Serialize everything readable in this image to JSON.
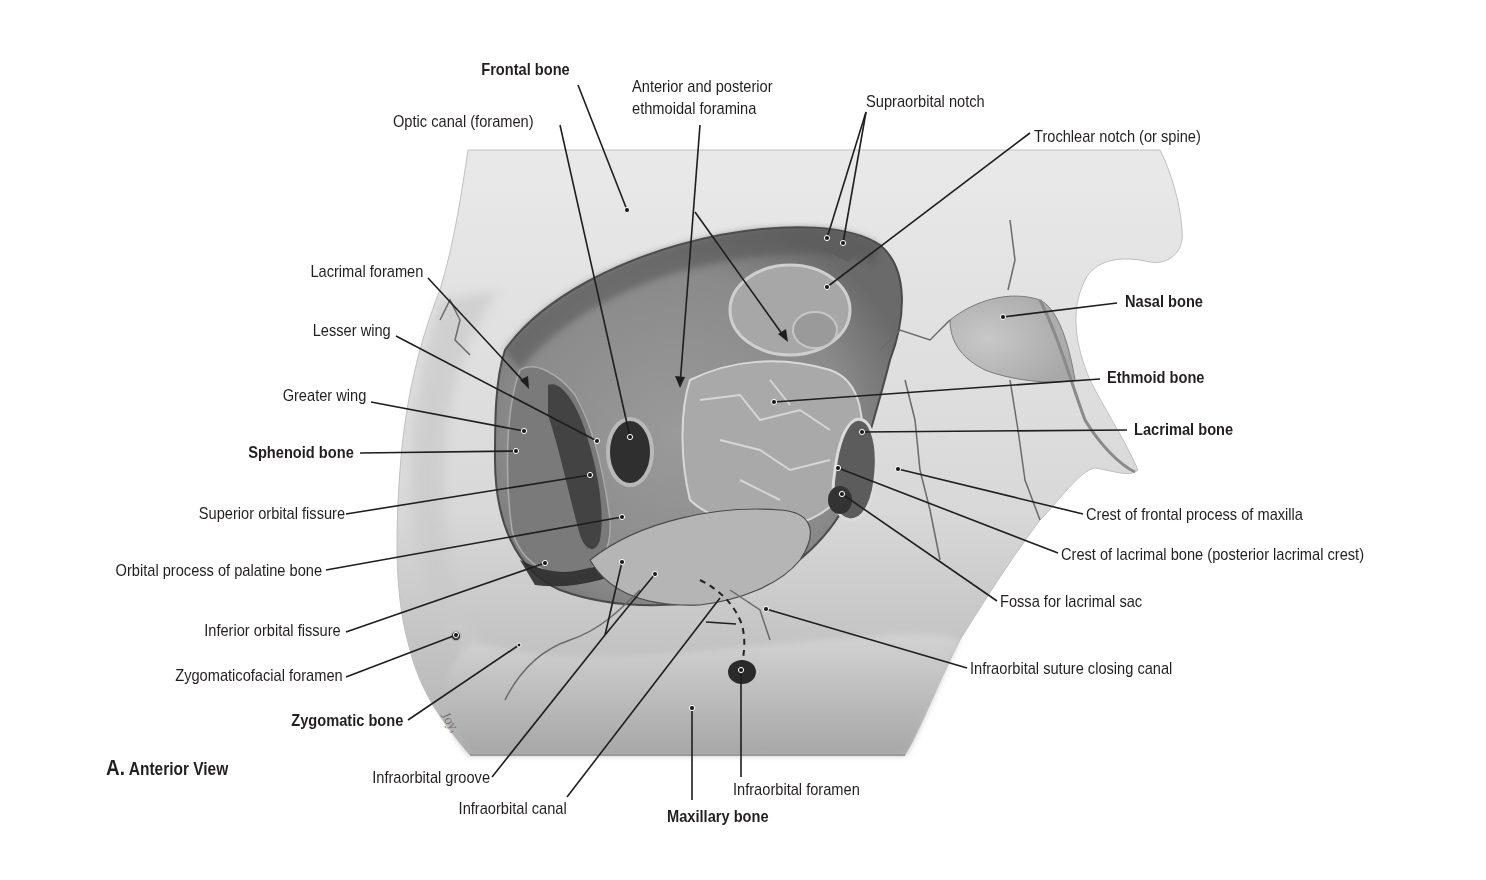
{
  "figure": {
    "caption_letter": "A.",
    "caption_view": "Anterior View",
    "signature": "Joy",
    "colors": {
      "background": "#ffffff",
      "text": "#231f20",
      "leader_line": "#1e1e1e",
      "bone_light": "#e6e6e6",
      "bone_mid": "#b9b9b9",
      "orbit_dark": "#6f6f6f",
      "foramen_dark": "#2e2e2e"
    }
  },
  "labels": {
    "frontal_bone": "Frontal bone",
    "optic_canal": "Optic canal (foramen)",
    "ethmoidal_foramina_line1": "Anterior and posterior",
    "ethmoidal_foramina_line2": "ethmoidal foramina",
    "supraorbital_notch": "Supraorbital notch",
    "trochlear_notch": "Trochlear notch (or spine)",
    "lacrimal_foramen": "Lacrimal foramen",
    "lesser_wing": "Lesser wing",
    "greater_wing": "Greater wing",
    "sphenoid_bone": "Sphenoid bone",
    "superior_orbital_fissure": "Superior orbital fissure",
    "orbital_process_palatine": "Orbital process of palatine bone",
    "inferior_orbital_fissure": "Inferior orbital fissure",
    "zygomaticofacial_foramen": "Zygomaticofacial foramen",
    "zygomatic_bone": "Zygomatic bone",
    "infraorbital_groove": "Infraorbital groove",
    "infraorbital_canal": "Infraorbital canal",
    "maxillary_bone": "Maxillary bone",
    "infraorbital_foramen": "Infraorbital foramen",
    "nasal_bone": "Nasal bone",
    "ethmoid_bone": "Ethmoid bone",
    "lacrimal_bone": "Lacrimal bone",
    "crest_frontal_process_maxilla": "Crest of frontal process of maxilla",
    "crest_lacrimal_bone": "Crest of lacrimal bone (posterior lacrimal crest)",
    "fossa_lacrimal_sac": "Fossa for lacrimal sac",
    "infraorbital_suture": "Infraorbital suture closing canal"
  }
}
